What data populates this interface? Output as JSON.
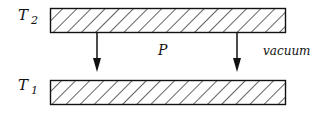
{
  "diagram": {
    "type": "parallel plates heat transfer",
    "labels": {
      "top_plate": {
        "symbol": "T",
        "subscript": "2"
      },
      "bottom_plate": {
        "symbol": "T",
        "subscript": "1"
      },
      "arrow_label": "P",
      "medium": "vacuum"
    },
    "plates": [
      {
        "name": "top",
        "x": 50,
        "y": 8,
        "width": 235,
        "height": 24
      },
      {
        "name": "bottom",
        "x": 50,
        "y": 80,
        "width": 235,
        "height": 24
      }
    ],
    "arrows": [
      {
        "x": 97,
        "y1": 32,
        "y2": 71
      },
      {
        "x": 237,
        "y1": 32,
        "y2": 71
      }
    ],
    "colors": {
      "stroke": "#111111",
      "background": "#ffffff"
    }
  }
}
